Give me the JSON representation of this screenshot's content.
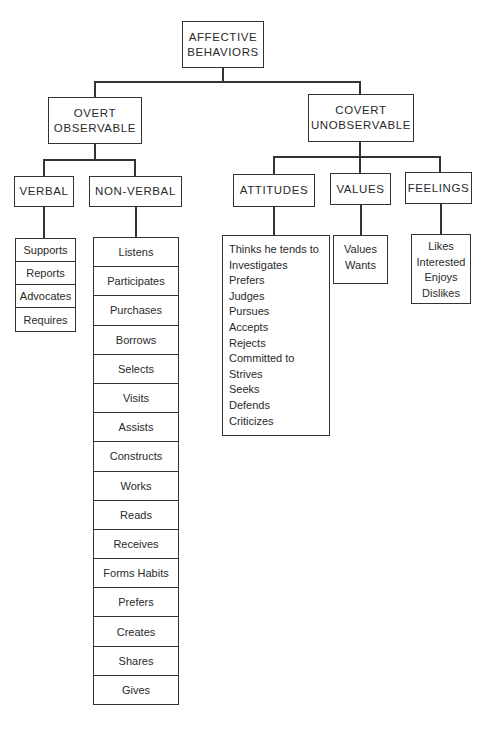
{
  "diagram": {
    "type": "hierarchy",
    "root": {
      "label_line1": "AFFECTIVE",
      "label_line2": "BEHAVIORS"
    },
    "branches": [
      {
        "label_line1": "OVERT",
        "label_line2": "OBSERVABLE",
        "children": [
          {
            "label": "VERBAL",
            "items": [
              "Supports",
              "Reports",
              "Advocates",
              "Requires"
            ]
          },
          {
            "label": "NON-VERBAL",
            "items": [
              "Listens",
              "Participates",
              "Purchases",
              "Borrows",
              "Selects",
              "Visits",
              "Assists",
              "Constructs",
              "Works",
              "Reads",
              "Receives",
              "Forms Habits",
              "Prefers",
              "Creates",
              "Shares",
              "Gives"
            ]
          }
        ]
      },
      {
        "label_line1": "COVERT",
        "label_line2": "UNOBSERVABLE",
        "children": [
          {
            "label": "ATTITUDES",
            "items": [
              "Thinks he tends to",
              "Investigates",
              "Prefers",
              "Judges",
              "Pursues",
              "Accepts",
              "Rejects",
              "Committed to",
              "Strives",
              "Seeks",
              "Defends",
              "Criticizes"
            ]
          },
          {
            "label": "VALUES",
            "items": [
              "Values",
              "Wants"
            ]
          },
          {
            "label": "FEELINGS",
            "items": [
              "Likes",
              "Interested",
              "Enjoys",
              "Dislikes"
            ]
          }
        ]
      }
    ]
  }
}
